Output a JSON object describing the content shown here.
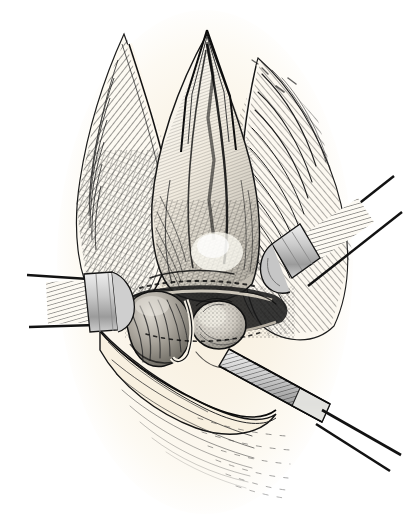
{
  "figure": {
    "kind": "anatomical-engraving",
    "title": "Operative field of an inguinal exposure",
    "caption_text": "",
    "technique": "line engraving / crosshatch wood-engraving",
    "has_visible_text": false,
    "orientation": "portrait",
    "width_px": 405,
    "height_px": 525
  },
  "colors": {
    "page_background": "#ffffff",
    "paper_tint": "#faf5ea",
    "paper_tint_deep": "#f4ead8",
    "ink": "#1a1a1a",
    "ink_soft": "#3a3a3a",
    "ink_mid": "#555555",
    "tissue_highlight": "#fffdf7",
    "tissue_shadow": "#8d8d8d",
    "metal_light": "#d8d8d8",
    "metal_mid": "#b4b4b4",
    "metal_dark": "#6e6e6e",
    "organ_pale": "#d6d2ca",
    "organ_mid": "#a9a49b"
  },
  "composition": {
    "background_shape": "vertical oval field of cream paper tone, white at the outer corners",
    "field_center_x": 205,
    "field_center_y": 262,
    "field_radius_x": 145,
    "field_radius_y": 250
  },
  "elements": [
    {
      "id": "incision-apex",
      "label": "apex of the incision",
      "note": "sharp inverted-V point at the top of the wound, heavy black outline"
    },
    {
      "id": "left-tissue-flap",
      "label": "retracted left tissue flap",
      "note": "long tapering flap with dense diagonal crosshatch, pale cut edge"
    },
    {
      "id": "right-tissue-flap",
      "label": "retracted right tissue flap",
      "note": "broad flap with fan-shaped hatching radiating outward"
    },
    {
      "id": "central-cord-structure",
      "label": "central cord / muscle body",
      "note": "tall shield-shaped mass with fine parallel hatching and a bright highlight"
    },
    {
      "id": "left-round-body",
      "label": "left rounded body",
      "note": "ovoid mass with radiating fibre lines, mid grey"
    },
    {
      "id": "right-round-body",
      "label": "right rounded body",
      "note": "smooth pale ovoid with a stippled rim"
    },
    {
      "id": "lower-wound-edge",
      "label": "lower wound edge",
      "note": "cream lip of skin closing the bottom of the wound"
    },
    {
      "id": "left-retractor",
      "label": "left flat retractor blade",
      "note": "hatched blade entering from the left with two slender shafts"
    },
    {
      "id": "right-retractor",
      "label": "right hooked retractor blade",
      "note": "hatched blade with hooked tip, shafts leaving to the upper right"
    },
    {
      "id": "lower-right-blade",
      "label": "lower right flat blade instrument",
      "note": "long hatched spatula angled down to the lower right"
    },
    {
      "id": "lower-field-hatching",
      "label": "lower tissue hatching",
      "note": "faint broken hatch lines fading into the paper below the wound"
    }
  ],
  "instruments": [
    {
      "name": "left-retractor",
      "count": 1,
      "shafts": 2
    },
    {
      "name": "right-retractor",
      "count": 1,
      "shafts": 2
    },
    {
      "name": "lower-right-blade",
      "count": 1,
      "shafts": 2
    }
  ]
}
